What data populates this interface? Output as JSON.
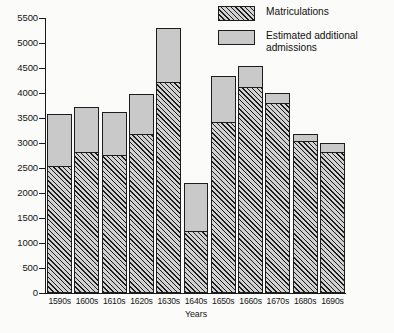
{
  "chart_data": {
    "type": "bar",
    "stacked": true,
    "title": "",
    "xlabel": "Years",
    "ylabel": "",
    "ylim": [
      0,
      5500
    ],
    "yticks": [
      0,
      500,
      1000,
      1500,
      2000,
      2500,
      3000,
      3500,
      4000,
      4500,
      5000,
      5500
    ],
    "ytick_labels": [
      "0",
      "500",
      "1000",
      "1500",
      "2000",
      "2500",
      "3000",
      "3500",
      "4000",
      "4500",
      "5000",
      "5500"
    ],
    "grid": false,
    "legend_position": "top-right",
    "categories": [
      "1590s",
      "1600s",
      "1610s",
      "1620s",
      "1630s",
      "1640s",
      "1650s",
      "1660s",
      "1670s",
      "1680s",
      "1690s"
    ],
    "series": [
      {
        "name": "Matriculations",
        "fill": "hatched",
        "color": "#d2d2d2",
        "values": [
          2550,
          2820,
          2770,
          3190,
          4230,
          1250,
          3430,
          4120,
          3800,
          3050,
          2830
        ]
      },
      {
        "name": "Estimated additional admissions",
        "fill": "solid",
        "color": "#c9c9c9",
        "values": [
          1030,
          910,
          860,
          800,
          1070,
          950,
          910,
          420,
          200,
          130,
          170
        ]
      }
    ],
    "totals": [
      3580,
      3730,
      3630,
      3990,
      5300,
      2200,
      4340,
      4540,
      4000,
      3180,
      3000
    ]
  },
  "legend": {
    "items": [
      {
        "label": "Matriculations",
        "icon": "hatched-swatch"
      },
      {
        "label": "Estimated additional admissions",
        "icon": "solid-swatch"
      }
    ]
  },
  "axes": {
    "x_title": "Years"
  }
}
